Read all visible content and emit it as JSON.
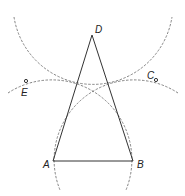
{
  "diagram": {
    "points": {
      "A": {
        "label": "A",
        "x": 53,
        "y": 161
      },
      "B": {
        "label": "B",
        "x": 133,
        "y": 161
      },
      "C": {
        "label": "C",
        "x": 156,
        "y": 80
      },
      "D": {
        "label": "D",
        "x": 92,
        "y": 35
      },
      "E": {
        "label": "E",
        "x": 26,
        "y": 81
      }
    },
    "segments": [
      "AB",
      "AD",
      "BD"
    ],
    "circles": [
      {
        "center": "A",
        "radius": 80,
        "style": "dashed"
      },
      {
        "center": "B",
        "radius": 80,
        "style": "dashed"
      },
      {
        "center": "D",
        "radius": 80,
        "style": "dashed"
      }
    ],
    "marked_points": [
      "E",
      "C"
    ]
  }
}
